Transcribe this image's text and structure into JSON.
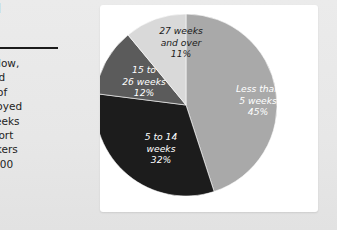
{
  "sidebar": {
    "heading": "…yed\n…nt,",
    "body": "…e is low,\n…loyed\n…ear of\n…mployed\n…5 weeks\n…e short\n…workers\n…n 2000",
    "divider": "horizontal-rule"
  },
  "chart_data": {
    "type": "pie",
    "title": "",
    "subtitle": "",
    "xlabel": "",
    "ylabel": "",
    "legend_position": "none",
    "grid": false,
    "start_angle_deg": 0,
    "direction": "clockwise",
    "unit": "%",
    "categories": [
      "Less than 5 weeks",
      "5 to 14 weeks",
      "15 to 26 weeks",
      "27 weeks and over"
    ],
    "values": [
      45,
      32,
      12,
      11
    ],
    "colors": [
      "#a9a9a9",
      "#1c1c1c",
      "#5b5b5b",
      "#d9d9d9"
    ],
    "label_colors": [
      "#ffffff",
      "#ffffff",
      "#ffffff",
      "#1b1b1b"
    ],
    "slices": [
      {
        "name": "Less than 5 weeks",
        "value": 45,
        "label": "Less than\n5 weeks\n45%",
        "percent_text": "45%",
        "color": "#a9a9a9",
        "text_color": "#ffffff"
      },
      {
        "name": "5 to 14 weeks",
        "value": 32,
        "label": "5 to 14\nweeks\n32%",
        "percent_text": "32%",
        "color": "#1c1c1c",
        "text_color": "#ffffff"
      },
      {
        "name": "15 to 26 weeks",
        "value": 12,
        "label": "15 to\n26 weeks\n12%",
        "percent_text": "12%",
        "color": "#5b5b5b",
        "text_color": "#ffffff"
      },
      {
        "name": "27 weeks and over",
        "value": 11,
        "label": "27 weeks\nand over\n11%",
        "percent_text": "11%",
        "color": "#d9d9d9",
        "text_color": "#1b1b1b"
      }
    ]
  },
  "page": {
    "background_color": "#e9e9e9",
    "card_background_color": "#ffffff"
  }
}
